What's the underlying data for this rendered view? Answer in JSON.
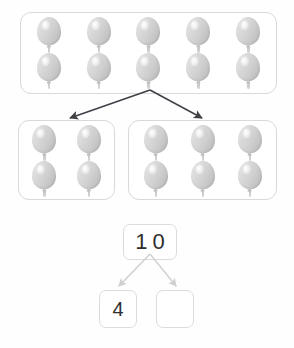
{
  "worksheet": {
    "title": "Number bond balloon decomposition",
    "background_color": "#fefefe"
  },
  "whole_group": {
    "name": "whole-balloon-group",
    "count": 10,
    "columns": 5,
    "rows": 2,
    "box": {
      "x": 20,
      "y": 12,
      "width": 257,
      "height": 82
    },
    "balloon_color": "#d2d2d2",
    "border_color": "#d9d9d9"
  },
  "part_groups": [
    {
      "name": "part-group-left",
      "count": 4,
      "columns": 2,
      "rows": 2,
      "box": {
        "x": 18,
        "y": 120,
        "width": 97,
        "height": 80
      }
    },
    {
      "name": "part-group-right",
      "count": 6,
      "columns": 3,
      "rows": 2,
      "box": {
        "x": 128,
        "y": 120,
        "width": 149,
        "height": 80
      }
    }
  ],
  "split_arrows": {
    "color": "#3f3f46",
    "origin": {
      "x": 150,
      "y": 2
    },
    "left_tip": {
      "x": 70,
      "y": 30
    },
    "right_tip": {
      "x": 202,
      "y": 30
    }
  },
  "number_bond": {
    "total_value": "10",
    "part_left_value": "4",
    "part_right_value": "",
    "arrow_color": "#cfcfcf",
    "box_border_color": "#dcdcdc",
    "text_color": "#2e2e2e",
    "origin": {
      "x": 150,
      "y": 2
    },
    "left_tip": {
      "x": 119,
      "y": 34
    },
    "right_tip": {
      "x": 176,
      "y": 34
    }
  }
}
